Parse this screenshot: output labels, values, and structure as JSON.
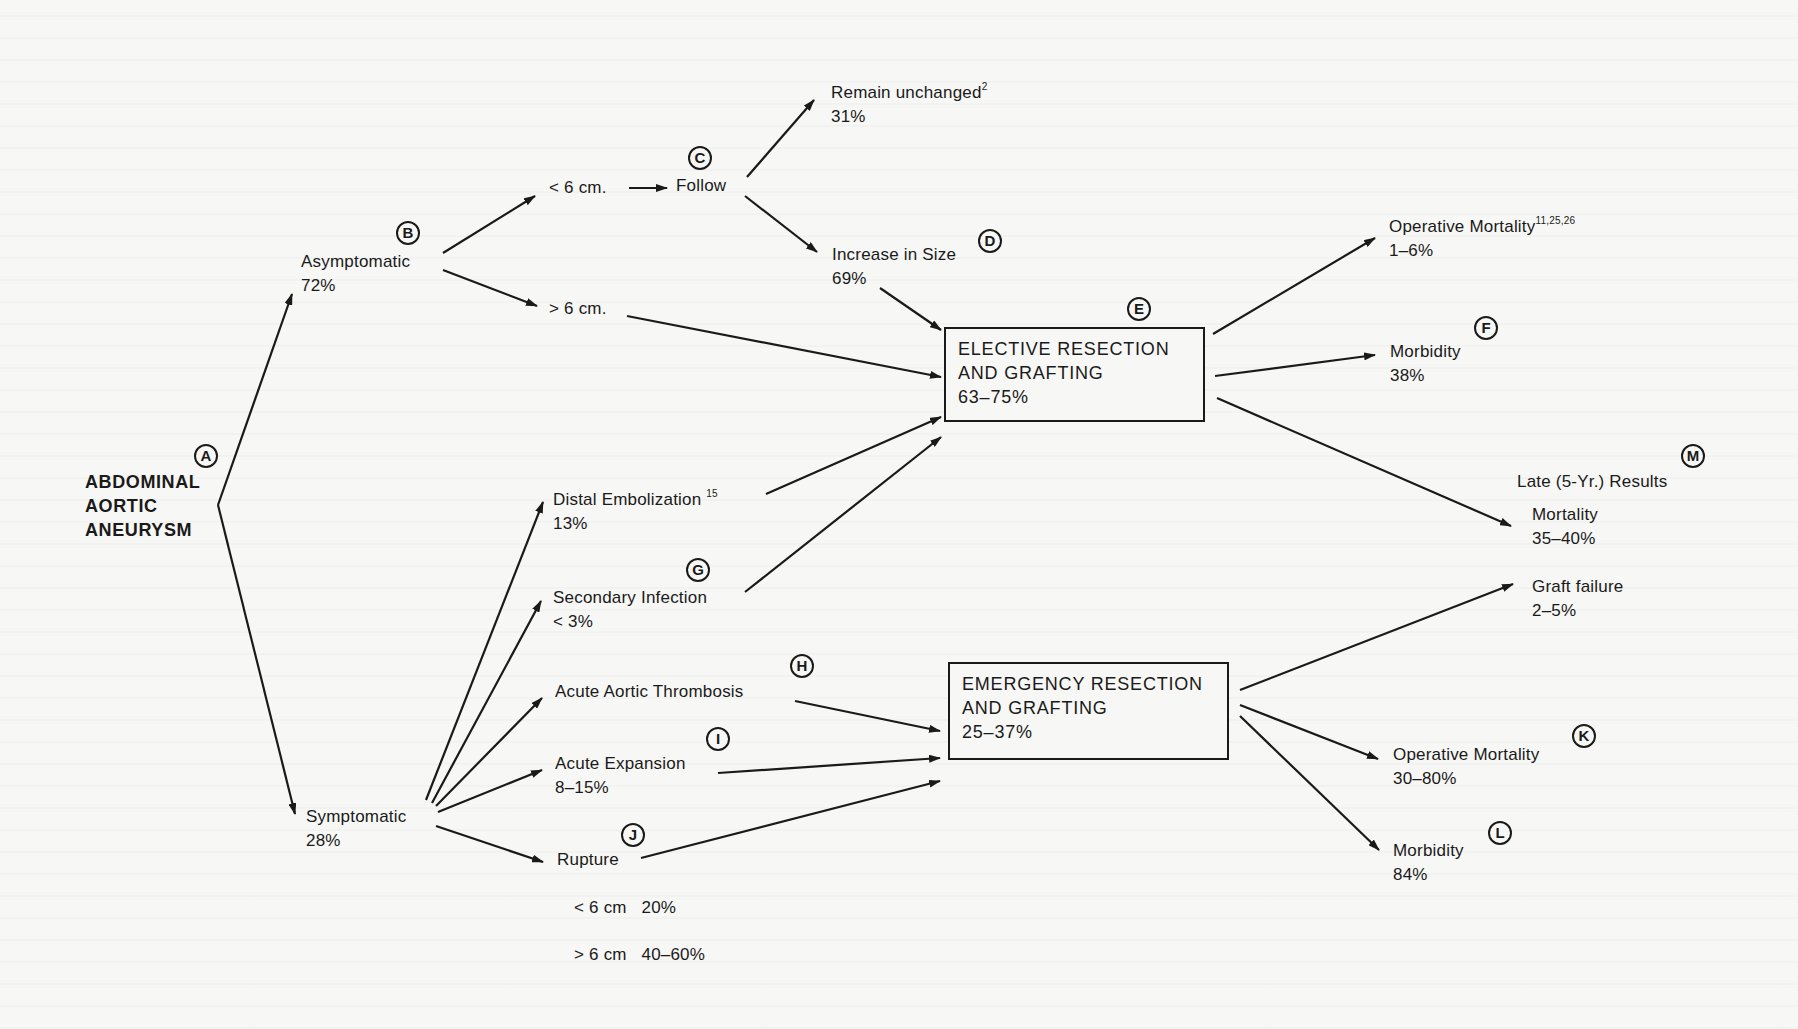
{
  "diagram": {
    "root": {
      "marker": "A",
      "lines": [
        "ABDOMINAL",
        "AORTIC",
        "ANEURYSM"
      ]
    },
    "asymptomatic": {
      "marker": "B",
      "label": "Asymptomatic",
      "value": "72%"
    },
    "symptomatic": {
      "label": "Symptomatic",
      "value": "28%"
    },
    "size_lt6": {
      "label": "< 6 cm."
    },
    "size_gt6": {
      "label": "> 6 cm."
    },
    "follow": {
      "marker": "C",
      "label": "Follow"
    },
    "remain_unchanged": {
      "label": "Remain unchanged",
      "ref": "2",
      "value": "31%"
    },
    "increase_in_size": {
      "marker": "D",
      "label": "Increase in Size",
      "value": "69%"
    },
    "elective": {
      "marker": "E",
      "lines": [
        "ELECTIVE RESECTION",
        "AND GRAFTING"
      ],
      "value": "63–75%"
    },
    "emergency": {
      "lines": [
        "EMERGENCY RESECTION",
        "AND GRAFTING"
      ],
      "value": "25–37%"
    },
    "distal_embolization": {
      "label": "Distal Embolization",
      "ref": "15",
      "value": "13%"
    },
    "secondary_infection": {
      "marker": "G",
      "label": "Secondary Infection",
      "value": "< 3%"
    },
    "acute_thrombosis": {
      "marker": "H",
      "label": "Acute Aortic Thrombosis"
    },
    "acute_expansion": {
      "marker": "I",
      "label": "Acute Expansion",
      "value": "8–15%"
    },
    "rupture": {
      "marker": "J",
      "label": "Rupture",
      "rows": [
        {
          "size": "< 6 cm",
          "value": "20%"
        },
        {
          "size": "> 6 cm",
          "value": "40–60%"
        }
      ]
    },
    "elective_op_mortality": {
      "label": "Operative Mortality",
      "ref": "11,25,26",
      "value": "1–6%"
    },
    "elective_morbidity": {
      "marker": "F",
      "label": "Morbidity",
      "value": "38%"
    },
    "late_results": {
      "marker": "M",
      "title": "Late (5-Yr.) Results",
      "mortality_label": "Mortality",
      "mortality_value": "35–40%",
      "graft_failure_label": "Graft failure",
      "graft_failure_value": "2–5%"
    },
    "emergency_op_mortality": {
      "marker": "K",
      "label": "Operative Mortality",
      "value": "30–80%"
    },
    "emergency_morbidity": {
      "marker": "L",
      "label": "Morbidity",
      "value": "84%"
    }
  },
  "colors": {
    "ink": "#1a1a1a",
    "paper": "#f7f7f5"
  }
}
